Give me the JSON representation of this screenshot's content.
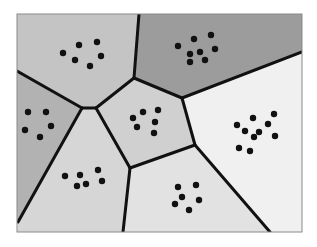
{
  "diagram": {
    "type": "voronoi-tessellation",
    "frame": {
      "x": 17,
      "y": 14,
      "width": 285,
      "height": 218,
      "border_color": "#8a8a8a"
    },
    "edge_color": "#111111",
    "dot_color": "#111111",
    "cells": [
      {
        "id": "top-left",
        "fill": "#c4c4c4",
        "polygon": [
          [
            17,
            14
          ],
          [
            139,
            14
          ],
          [
            134,
            78
          ],
          [
            96,
            108
          ],
          [
            82,
            108
          ],
          [
            17,
            71
          ]
        ],
        "points": [
          [
            63,
            53
          ],
          [
            79,
            45
          ],
          [
            75,
            60
          ],
          [
            97,
            42
          ],
          [
            101,
            56
          ],
          [
            90,
            66
          ]
        ]
      },
      {
        "id": "top-right",
        "fill": "#9c9c9c",
        "polygon": [
          [
            139,
            14
          ],
          [
            302,
            14
          ],
          [
            302,
            52
          ],
          [
            182,
            98
          ],
          [
            134,
            78
          ]
        ],
        "points": [
          [
            178,
            46
          ],
          [
            194,
            39
          ],
          [
            190,
            54
          ],
          [
            200,
            52
          ],
          [
            211,
            35
          ],
          [
            215,
            49
          ],
          [
            190,
            62
          ],
          [
            205,
            60
          ]
        ]
      },
      {
        "id": "left",
        "fill": "#b2b2b2",
        "polygon": [
          [
            17,
            71
          ],
          [
            82,
            108
          ],
          [
            18,
            222
          ],
          [
            17,
            222
          ]
        ],
        "points": [
          [
            28,
            112
          ],
          [
            46,
            112
          ],
          [
            25,
            130
          ],
          [
            40,
            137
          ],
          [
            51,
            126
          ]
        ]
      },
      {
        "id": "center",
        "fill": "#d0d0d0",
        "polygon": [
          [
            96,
            108
          ],
          [
            134,
            78
          ],
          [
            182,
            98
          ],
          [
            195,
            145
          ],
          [
            130,
            168
          ]
        ],
        "points": [
          [
            133,
            118
          ],
          [
            143,
            112
          ],
          [
            158,
            110
          ],
          [
            137,
            127
          ],
          [
            155,
            122
          ],
          [
            154,
            133
          ]
        ]
      },
      {
        "id": "right",
        "fill": "#f0f0f0",
        "polygon": [
          [
            302,
            52
          ],
          [
            302,
            232
          ],
          [
            270,
            232
          ],
          [
            195,
            145
          ],
          [
            182,
            98
          ]
        ],
        "points": [
          [
            237,
            125
          ],
          [
            253,
            118
          ],
          [
            268,
            124
          ],
          [
            274,
            114
          ],
          [
            245,
            131
          ],
          [
            259,
            132
          ],
          [
            275,
            136
          ],
          [
            254,
            137
          ],
          [
            239,
            148
          ],
          [
            250,
            151
          ]
        ]
      },
      {
        "id": "bottom-left",
        "fill": "#d6d6d6",
        "polygon": [
          [
            82,
            108
          ],
          [
            96,
            108
          ],
          [
            130,
            168
          ],
          [
            123,
            232
          ],
          [
            17,
            232
          ],
          [
            18,
            222
          ]
        ],
        "points": [
          [
            65,
            176
          ],
          [
            80,
            175
          ],
          [
            98,
            170
          ],
          [
            77,
            186
          ],
          [
            86,
            184
          ],
          [
            102,
            181
          ]
        ]
      },
      {
        "id": "bottom-right",
        "fill": "#e2e2e2",
        "polygon": [
          [
            130,
            168
          ],
          [
            195,
            145
          ],
          [
            270,
            232
          ],
          [
            123,
            232
          ]
        ],
        "points": [
          [
            178,
            187
          ],
          [
            196,
            185
          ],
          [
            182,
            197
          ],
          [
            199,
            200
          ],
          [
            175,
            204
          ],
          [
            189,
            210
          ]
        ]
      }
    ],
    "edges": [
      [
        [
          139,
          14
        ],
        [
          134,
          78
        ]
      ],
      [
        [
          134,
          78
        ],
        [
          182,
          98
        ]
      ],
      [
        [
          182,
          98
        ],
        [
          302,
          52
        ]
      ],
      [
        [
          17,
          71
        ],
        [
          82,
          108
        ]
      ],
      [
        [
          82,
          108
        ],
        [
          96,
          108
        ]
      ],
      [
        [
          96,
          108
        ],
        [
          134,
          78
        ]
      ],
      [
        [
          82,
          108
        ],
        [
          18,
          222
        ]
      ],
      [
        [
          96,
          108
        ],
        [
          130,
          168
        ]
      ],
      [
        [
          130,
          168
        ],
        [
          195,
          145
        ]
      ],
      [
        [
          182,
          98
        ],
        [
          195,
          145
        ]
      ],
      [
        [
          195,
          145
        ],
        [
          270,
          232
        ]
      ],
      [
        [
          130,
          168
        ],
        [
          123,
          232
        ]
      ]
    ]
  }
}
